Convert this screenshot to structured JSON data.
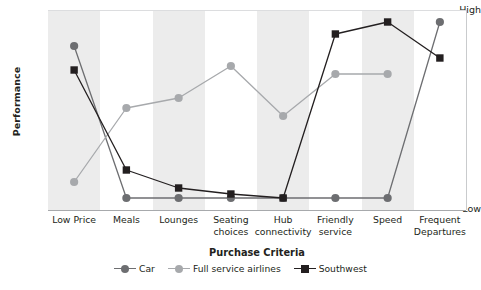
{
  "chart_data": {
    "type": "line",
    "title": "",
    "xlabel": "Purchase Criteria",
    "ylabel": "Performance",
    "categories": [
      "Low Price",
      "Meals",
      "Lounges",
      "Seating choices",
      "Hub connectivity",
      "Friendly service",
      "Speed",
      "Frequent Departures"
    ],
    "ytick_labels": [
      "High",
      "Low"
    ],
    "ylim": [
      0,
      1
    ],
    "grid": false,
    "legend_position": "bottom",
    "banded_background": true,
    "series": [
      {
        "name": "Car",
        "color": "#6d6e71",
        "marker": "circle",
        "values": [
          0.82,
          0.06,
          0.06,
          0.06,
          0.06,
          0.06,
          0.06,
          0.94
        ]
      },
      {
        "name": "Full service airlines",
        "color": "#a7a9ac",
        "marker": "circle",
        "values": [
          0.14,
          0.51,
          0.56,
          0.72,
          0.47,
          0.68,
          0.68,
          null
        ]
      },
      {
        "name": "Southwest",
        "color": "#231f20",
        "marker": "square",
        "values": [
          0.7,
          0.2,
          0.11,
          0.08,
          0.06,
          0.88,
          0.94,
          0.76
        ]
      }
    ]
  },
  "axes": {
    "y_title": "Performance",
    "y_high_label": "High",
    "y_low_label": "Low",
    "x_title": "Purchase Criteria"
  },
  "legend": {
    "items": [
      {
        "label": "Car",
        "color": "#6d6e71",
        "marker": "circle"
      },
      {
        "label": "Full service airlines",
        "color": "#a7a9ac",
        "marker": "circle"
      },
      {
        "label": "Southwest",
        "color": "#231f20",
        "marker": "square"
      }
    ]
  },
  "colors": {
    "band": "#ececec",
    "axis": "#a7a9ac",
    "text": "#231f20",
    "car": "#6d6e71",
    "full_service": "#a7a9ac",
    "southwest": "#231f20"
  }
}
